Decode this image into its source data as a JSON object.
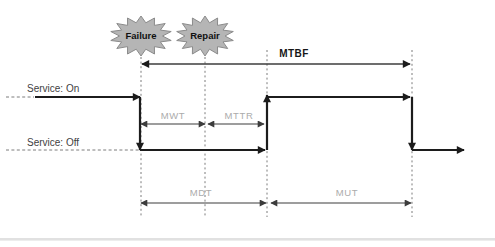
{
  "diagram": {
    "events": {
      "failure": "Failure",
      "repair": "Repair"
    },
    "service": {
      "on": "Service: On",
      "off": "Service: Off"
    },
    "measures": {
      "mtbf": "MTBF",
      "mwt": "MWT",
      "mttr": "MTTR",
      "mdt": "MDT",
      "mut": "MUT"
    },
    "colors": {
      "signal": "#1c1c1c",
      "measure_line": "#3c3c3c",
      "dashed_guide": "#7d7d7d",
      "starburst_fill": "#b5b5b5",
      "starburst_stroke": "#8b8b8b",
      "service_label": "#3f3f3f",
      "measure_label_gray": "#ababab",
      "mtbf_label": "#161616",
      "bottom_band": "#e1e1e1"
    }
  }
}
